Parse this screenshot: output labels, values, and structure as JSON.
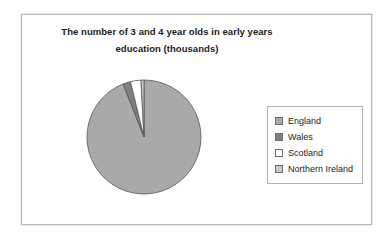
{
  "chart_data": {
    "type": "pie",
    "title": "The number of 3 and 4 year olds in early years education (thousands)",
    "title_line1": "The number of 3 and 4 year olds in early years",
    "title_line2": "education (thousands)",
    "xlabel": "",
    "ylabel": "",
    "legend_position": "right",
    "grid": false,
    "start_angle_deg": 0,
    "direction": "clockwise",
    "categories": [
      "England",
      "Wales",
      "Scotland",
      "Northern Ireland"
    ],
    "values": [
      1134,
      26,
      36,
      10
    ],
    "percentages": [
      94.0,
      2.2,
      3.0,
      0.8
    ],
    "slice_angles_deg": [
      338.4,
      7.8,
      10.8,
      3.0
    ],
    "colors": [
      "#a9a9a9",
      "#7e7e7e",
      "#ffffff",
      "#c9c9c9"
    ],
    "slice_border_color": "#555555",
    "slices": [
      {
        "label": "England",
        "value": 1134,
        "percent": 94.0,
        "color": "#a9a9a9"
      },
      {
        "label": "Wales",
        "value": 26,
        "percent": 2.2,
        "color": "#7e7e7e"
      },
      {
        "label": "Scotland",
        "value": 36,
        "percent": 3.0,
        "color": "#ffffff"
      },
      {
        "label": "Northern Ireland",
        "value": 10,
        "percent": 0.8,
        "color": "#c9c9c9"
      }
    ]
  },
  "legend": {
    "items": [
      {
        "label": "England",
        "color": "#a9a9a9"
      },
      {
        "label": "Wales",
        "color": "#7e7e7e"
      },
      {
        "label": "Scotland",
        "color": "#ffffff"
      },
      {
        "label": "Northern Ireland",
        "color": "#c9c9c9"
      }
    ]
  },
  "frame": {
    "border_color": "#b9b9b9",
    "background": "#ffffff"
  }
}
